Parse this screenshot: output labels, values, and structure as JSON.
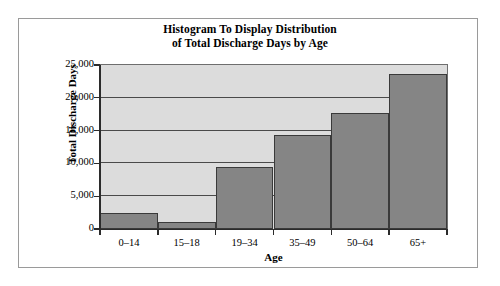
{
  "chart_data": {
    "type": "bar",
    "title": "Histogram To Display Distribution of Total Discharge Days by Age",
    "title_lines": [
      "Histogram To Display Distribution",
      "of Total Discharge Days by Age"
    ],
    "xlabel": "Age",
    "ylabel": "Total Discharge Days",
    "categories": [
      "0–14",
      "15–18",
      "19–34",
      "35–49",
      "50–64",
      "65+"
    ],
    "values": [
      2440,
      1070,
      9500,
      14300,
      17700,
      23600
    ],
    "ylim": [
      0,
      25000
    ],
    "ytick_values": [
      0,
      5000,
      10000,
      15000,
      20000,
      25000
    ],
    "ytick_labels": [
      "0",
      "5,000",
      "10,000",
      "15,000",
      "20,000",
      "25,000"
    ],
    "grid": true,
    "legend": false,
    "bar_color": "#858585",
    "bar_edge_color": "#3a3a3a",
    "plot_background": "#dcdcdc",
    "gridline_color": "#4a4a4a",
    "axis_color": "#2b2b2b",
    "figure_background": "#ffffff",
    "frame_color": "#9a9a9a"
  }
}
